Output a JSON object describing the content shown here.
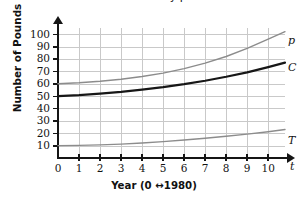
{
  "chart_data": {
    "type": "line",
    "title": "Chicken and Turkey per Person",
    "title_clipped_note": "",
    "xlabel": "Year (0 ↔1980)",
    "ylabel": "Number of Pounds",
    "x_axis_symbol": "t",
    "xlim": [
      0,
      10.8
    ],
    "ylim": [
      0,
      105
    ],
    "x_ticks": [
      "0",
      "1",
      "2",
      "3",
      "4",
      "5",
      "6",
      "7",
      "8",
      "9",
      "10"
    ],
    "y_ticks": [
      "10",
      "20",
      "30",
      "40",
      "50",
      "60",
      "70",
      "80",
      "90",
      "100"
    ],
    "grid": true,
    "legend_position": "right-inline-curve-labels",
    "x": [
      0,
      1,
      2,
      3,
      4,
      5,
      6,
      7,
      8,
      9,
      10,
      10.8
    ],
    "series": [
      {
        "name": "P",
        "label": "p",
        "color": "#8c8c8c",
        "width": 1.4,
        "values": [
          60,
          60.8,
          62,
          63.6,
          65.8,
          68.6,
          72.2,
          76.6,
          82,
          88.5,
          96,
          102
        ]
      },
      {
        "name": "C",
        "label": "C",
        "color": "#171717",
        "width": 2.2,
        "values": [
          50,
          50.8,
          52,
          53.4,
          55.2,
          57.2,
          59.6,
          62.4,
          65.6,
          69.2,
          73.4,
          77
        ]
      },
      {
        "name": "T",
        "label": "T",
        "color": "#8c8c8c",
        "width": 1.4,
        "values": [
          10,
          10.2,
          10.6,
          11.2,
          12.1,
          13.2,
          14.5,
          16.0,
          17.6,
          19.3,
          21.2,
          23
        ]
      }
    ],
    "colors": {
      "axis": "#151515",
      "grid": "#c9c9c9",
      "text": "#141414",
      "background": "#ffffff"
    }
  },
  "curve_labels": {
    "p": "p",
    "c": "C",
    "t": "T"
  }
}
